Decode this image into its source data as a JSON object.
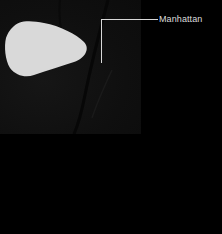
{
  "map": {
    "callout": {
      "label": "Manhattan"
    },
    "colors": {
      "background": "#000000",
      "tile": "#111111",
      "highlight": "#d9d9d9",
      "callout_line": "#d8d8d8"
    }
  }
}
